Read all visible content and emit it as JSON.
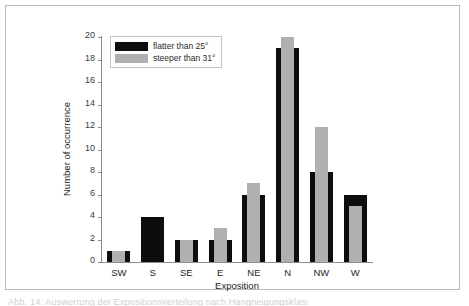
{
  "figure": {
    "caption_sliver": "Abb. 14: Auswertung der Expositionsverteilung nach Hangneigungsklassen"
  },
  "chart_data": {
    "type": "bar",
    "title": "",
    "xlabel": "Exposition",
    "ylabel": "Number of occurrence",
    "categories": [
      "SW",
      "S",
      "SE",
      "E",
      "NE",
      "N",
      "NW",
      "W"
    ],
    "series": [
      {
        "name": "flatter than 25°",
        "color": "#0d0d0d",
        "values": [
          1,
          4,
          2,
          2,
          6,
          19,
          8,
          6
        ]
      },
      {
        "name": "steeper than 31°",
        "color": "#b0b0b0",
        "values": [
          1,
          0,
          2,
          3,
          7,
          20,
          12,
          5
        ]
      }
    ],
    "ylim": [
      0,
      20
    ],
    "yticks": [
      0,
      2,
      4,
      6,
      8,
      10,
      12,
      14,
      16,
      18,
      20
    ],
    "grid": false,
    "legend_position": "top-left",
    "bar_style": "overlapping"
  }
}
